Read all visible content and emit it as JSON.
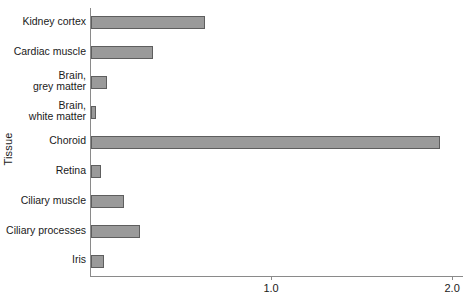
{
  "chart_data": {
    "type": "bar",
    "orientation": "horizontal",
    "title": "",
    "xlabel": "Tissue/blood partition coefficient (Kp)",
    "ylabel": "Tissue",
    "categories": [
      "Kidney cortex",
      "Cardiac muscle",
      "Brain,\ngrey matter",
      "Brain,\nwhite matter",
      "Choroid",
      "Retina",
      "Ciliary muscle",
      "Ciliary processes",
      "Iris"
    ],
    "values": [
      0.63,
      0.34,
      0.09,
      0.03,
      1.93,
      0.055,
      0.18,
      0.27,
      0.07
    ],
    "xlim": [
      0,
      2.06
    ],
    "xticks": [
      1.0,
      2.0
    ],
    "xticklabels": [
      "1.0",
      "2.0"
    ],
    "grid": false,
    "legend": false,
    "bar_fill_color": "#9a9a9a",
    "bar_edge_color": "#5e5e5e",
    "axis_color": "#8a8a8a"
  },
  "axes": {
    "y_title": "Tissue",
    "x_title": "",
    "x_tick_labels": [
      "1.0",
      "2.0"
    ]
  }
}
